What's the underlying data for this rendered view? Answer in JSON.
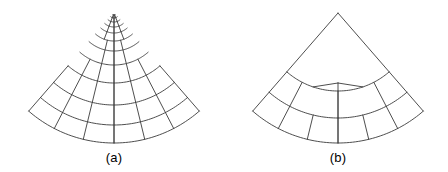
{
  "figure": {
    "background_color": "#ffffff",
    "line_color": "#3a3a3a",
    "caption_color": "#000000",
    "width": 448,
    "height": 172
  },
  "panels": [
    {
      "id": "a",
      "caption": "(a)",
      "caption_x": 114,
      "caption_y": 150,
      "description": "curved triangular sector mesh with graded radial refinement toward an interior singular point",
      "mesh": {
        "type": "polar-sector",
        "apex_x": 114,
        "apex_y": 13,
        "singular_point_x": 114,
        "singular_point_y": 85,
        "outer_radius": 130,
        "half_angle_deg": 41,
        "ring_radii": [
          130,
          112,
          92,
          70,
          52,
          38,
          28,
          20,
          14,
          9,
          5,
          2
        ],
        "ray_count": 6,
        "graded": true,
        "corner_left": [
          16,
          130
        ],
        "corner_right": [
          212,
          131
        ],
        "bottom_center": [
          114,
          143
        ]
      }
    },
    {
      "id": "b",
      "caption": "(b)",
      "caption_x": 338,
      "caption_y": 150,
      "description": "same curved triangular sector as a coarse mesh with a trivalent Y junction at the centre",
      "mesh": {
        "type": "polar-sector-coarse",
        "apex_x": 114,
        "apex_y": 13,
        "junction_x": 114,
        "junction_y": 83,
        "outer_radius": 130,
        "half_angle_deg": 41,
        "ring_radii": [
          130,
          105,
          78
        ],
        "ray_count": 6,
        "graded": false,
        "y_junction": true,
        "corner_left": [
          16,
          130
        ],
        "corner_right": [
          212,
          131
        ],
        "bottom_center": [
          114,
          143
        ]
      }
    }
  ]
}
